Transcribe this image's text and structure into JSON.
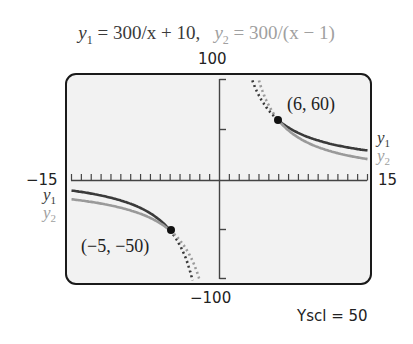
{
  "title": {
    "y1_label": "y",
    "y1_sub": "1",
    "y1_expr": " = 300/x + 10,",
    "y2_label": "y",
    "y2_sub": "2",
    "y2_expr": " = 300/(x − 1)"
  },
  "axes": {
    "ymax_label": "100",
    "ymin_label": "−100",
    "xmin_label": "−15",
    "xmax_label": "15",
    "yscl_label": "Yscl = 50"
  },
  "legend": {
    "right_y1": "y",
    "right_y1_sub": "1",
    "right_y2": "y",
    "right_y2_sub": "2",
    "left_y1": "y",
    "left_y1_sub": "1",
    "left_y2": "y",
    "left_y2_sub": "2"
  },
  "points": {
    "p1_label": "(6, 60)",
    "p2_label": "(−5, −50)"
  },
  "colors": {
    "y1": "#3a3a3a",
    "y2": "#9a9a9a",
    "screen_bg": "#f2f2f2",
    "frame": "#1a1a1a"
  },
  "chart_data": {
    "type": "line",
    "xlabel": "",
    "ylabel": "",
    "xlim": [
      -15,
      15
    ],
    "ylim": [
      -100,
      100
    ],
    "xscl": 1,
    "yscl": 50,
    "grid": false,
    "series": [
      {
        "name": "y1",
        "formula": "300/x + 10",
        "x": [
          -15,
          -12,
          -10,
          -8,
          -6,
          -5,
          -4,
          -3,
          3,
          4,
          5,
          6,
          8,
          10,
          12,
          15
        ],
        "values": [
          -10,
          -15,
          -20,
          -27.5,
          -40,
          -50,
          -65,
          -90,
          110,
          85,
          70,
          60,
          47.5,
          40,
          35,
          30
        ]
      },
      {
        "name": "y2",
        "formula": "300/(x − 1)",
        "x": [
          -15,
          -12,
          -10,
          -8,
          -6,
          -5,
          -4,
          -3,
          4,
          5,
          6,
          8,
          10,
          12,
          15
        ],
        "values": [
          -18.75,
          -23.08,
          -27.27,
          -33.33,
          -42.86,
          -50,
          -60,
          -75,
          100,
          75,
          60,
          42.86,
          33.33,
          27.27,
          21.43
        ]
      }
    ],
    "annotations": [
      {
        "label": "(6, 60)",
        "x": 6,
        "y": 60
      },
      {
        "label": "(−5, −50)",
        "x": -5,
        "y": -50
      }
    ],
    "legend_position": "inline at curve ends"
  }
}
